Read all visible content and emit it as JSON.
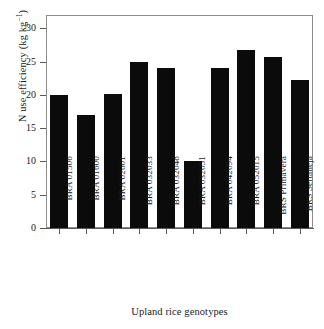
{
  "chart_data": {
    "type": "bar",
    "title": "",
    "xlabel": "Upland rice genotypes",
    "ylabel": "N use efficiency (kg kg",
    "ylabel_exponent": "−1",
    "ylabel_tail": ")",
    "categories": [
      "BRA 01506",
      "BRA 01600",
      "BRA 02601",
      "BRA 032033",
      "BRA 032048",
      "BRA 032051",
      "BRA 042094",
      "BRA 052015",
      "BRS Primavera",
      "BRS Sertaneja"
    ],
    "values": [
      20.0,
      17.0,
      20.1,
      24.9,
      24.0,
      10.0,
      24.0,
      26.8,
      25.7,
      22.2
    ],
    "ylim": [
      0,
      32
    ],
    "yticks": [
      0,
      5,
      10,
      15,
      20,
      25,
      30
    ],
    "ytick_labels": [
      "0",
      "5",
      "10",
      "15",
      "20",
      "25",
      "30"
    ],
    "grid": false,
    "legend": null,
    "bar_color": "#0b0b0b",
    "axis_color": "#5a5a5a",
    "background": "#ffffff"
  }
}
